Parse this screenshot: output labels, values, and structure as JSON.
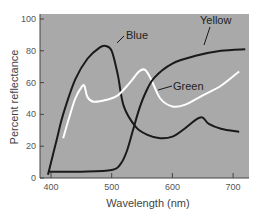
{
  "chart_data": {
    "type": "line",
    "title": "",
    "xlabel": "Wavelength (nm)",
    "ylabel": "Percent reflectance",
    "xlim": [
      385,
      730
    ],
    "ylim": [
      0,
      100
    ],
    "xticks": [
      400,
      500,
      600,
      700
    ],
    "yticks": [
      0,
      20,
      40,
      60,
      80,
      100
    ],
    "grid": false,
    "legend": "inline labels",
    "background": "#a9a9a9",
    "series": [
      {
        "name": "Blue",
        "color": "#1a1a1a",
        "x": [
          395,
          410,
          420,
          440,
          460,
          480,
          490,
          500,
          510,
          520,
          540,
          560,
          580,
          600,
          620,
          640,
          650,
          660,
          680,
          710
        ],
        "values": [
          2,
          25,
          40,
          62,
          75,
          82,
          83,
          80,
          65,
          45,
          32,
          27,
          25,
          26,
          31,
          37,
          38,
          34,
          31,
          29
        ]
      },
      {
        "name": "Green",
        "color": "#ffffff",
        "x": [
          420,
          430,
          440,
          450,
          455,
          460,
          470,
          490,
          510,
          530,
          545,
          555,
          565,
          580,
          600,
          620,
          650,
          680,
          710
        ],
        "values": [
          25,
          38,
          50,
          57,
          58,
          51,
          48,
          49,
          52,
          60,
          67,
          68,
          62,
          50,
          45,
          46,
          52,
          58,
          67
        ]
      },
      {
        "name": "Yellow",
        "color": "#1a1a1a",
        "x": [
          395,
          450,
          500,
          515,
          525,
          535,
          545,
          555,
          570,
          600,
          640,
          680,
          720
        ],
        "values": [
          4,
          4,
          5,
          9,
          17,
          30,
          43,
          53,
          63,
          72,
          77,
          80,
          81
        ]
      }
    ],
    "annotations": [
      {
        "text": "Blue",
        "x": 505,
        "y": 82
      },
      {
        "text": "Yellow",
        "x": 630,
        "y": 92
      },
      {
        "text": "Green",
        "x": 600,
        "y": 56
      }
    ]
  }
}
